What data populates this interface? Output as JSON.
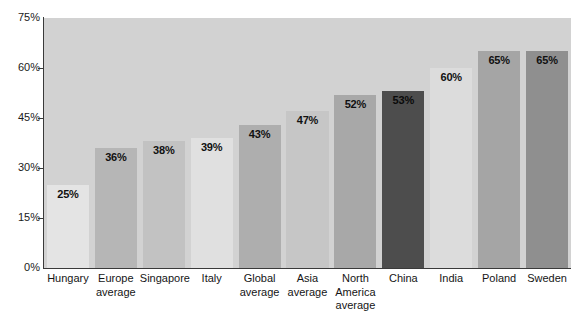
{
  "chart_data": {
    "type": "bar",
    "title": "",
    "xlabel": "",
    "ylabel": "",
    "ylim": [
      0,
      75
    ],
    "grid": false,
    "legend": "none",
    "ytick_labels": [
      "75%",
      "60%",
      "45%",
      "30%",
      "15%",
      "0%"
    ],
    "ytick_values": [
      75,
      60,
      45,
      30,
      15,
      0
    ],
    "categories": [
      "Hungary",
      "Europe average",
      "Singapore",
      "Italy",
      "Global average",
      "Asia average",
      "North America average",
      "China",
      "India",
      "Poland",
      "Sweden"
    ],
    "values": [
      25,
      36,
      38,
      39,
      43,
      47,
      52,
      53,
      60,
      65,
      65
    ],
    "value_labels": [
      "25%",
      "36%",
      "38%",
      "39%",
      "43%",
      "47%",
      "52%",
      "53%",
      "60%",
      "65%",
      "65%"
    ],
    "bars": [
      {
        "label_line1": "Hungary",
        "label_line2": "",
        "value": 25,
        "value_label": "25%",
        "color": "#e4e4e4"
      },
      {
        "label_line1": "Europe",
        "label_line2": "average",
        "value": 36,
        "value_label": "36%",
        "color": "#b6b6b6"
      },
      {
        "label_line1": "Singapore",
        "label_line2": "",
        "value": 38,
        "value_label": "38%",
        "color": "#c2c2c2"
      },
      {
        "label_line1": "Italy",
        "label_line2": "",
        "value": 39,
        "value_label": "39%",
        "color": "#e0e0e0"
      },
      {
        "label_line1": "Global",
        "label_line2": "average",
        "value": 43,
        "value_label": "43%",
        "color": "#aeaeae"
      },
      {
        "label_line1": "Asia",
        "label_line2": "average",
        "value": 47,
        "value_label": "47%",
        "color": "#c6c6c6"
      },
      {
        "label_line1": "North",
        "label_line2": "America average",
        "value": 52,
        "value_label": "52%",
        "color": "#a8a8a8"
      },
      {
        "label_line1": "China",
        "label_line2": "",
        "value": 53,
        "value_label": "53%",
        "color": "#4d4d4d"
      },
      {
        "label_line1": "India",
        "label_line2": "",
        "value": 60,
        "value_label": "60%",
        "color": "#dcdcdc"
      },
      {
        "label_line1": "Poland",
        "label_line2": "",
        "value": 65,
        "value_label": "65%",
        "color": "#a5a5a5"
      },
      {
        "label_line1": "Sweden",
        "label_line2": "",
        "value": 65,
        "value_label": "65%",
        "color": "#8f8f8f"
      }
    ],
    "plot_background": "#d2d2d2",
    "axis_color": "#3a3a3a",
    "highlight_category": "China",
    "highlight_color": "#4d4d4d"
  }
}
